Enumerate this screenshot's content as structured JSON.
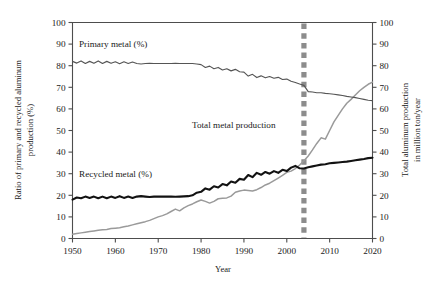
{
  "chart_data": {
    "type": "line",
    "title": "",
    "xlabel": "Year",
    "ylabel": "Ratio of primary and recycled aluminum production (%)",
    "y2label": "Total aluminum production in million ton/year",
    "xlim": [
      1950,
      2020
    ],
    "ylim": [
      0,
      100
    ],
    "y2lim": [
      0,
      100
    ],
    "grid": false,
    "legend_position": "inline-annotations",
    "xticks": [
      1950,
      1960,
      1970,
      1980,
      1990,
      2000,
      2010,
      2020
    ],
    "yticks": [
      0,
      10,
      20,
      30,
      40,
      50,
      60,
      70,
      80,
      90,
      100
    ],
    "y2ticks": [
      0,
      10,
      20,
      30,
      40,
      50,
      60,
      70,
      80,
      90,
      100
    ],
    "annotations": [
      {
        "name": "primary-metal-label",
        "text": "Primary metal (%)",
        "x": 1954,
        "y": 88
      },
      {
        "name": "recycled-metal-label",
        "text": "Recycled metal (%)",
        "x": 1954,
        "y": 27
      },
      {
        "name": "total-metal-label",
        "text": "Total metal production",
        "x": 1987,
        "y": 52
      },
      {
        "name": "marker-year-2004",
        "text": "",
        "x": 2004,
        "y": 0
      }
    ],
    "marker_line": {
      "x": 2004,
      "style": "dashed",
      "color": "#8c8c8c",
      "label": ""
    },
    "x": [
      1950,
      1951,
      1952,
      1953,
      1954,
      1955,
      1956,
      1957,
      1958,
      1959,
      1960,
      1961,
      1962,
      1963,
      1964,
      1965,
      1966,
      1967,
      1968,
      1969,
      1970,
      1971,
      1972,
      1973,
      1974,
      1975,
      1976,
      1977,
      1978,
      1979,
      1980,
      1981,
      1982,
      1983,
      1984,
      1985,
      1986,
      1987,
      1988,
      1989,
      1990,
      1991,
      1992,
      1993,
      1994,
      1995,
      1996,
      1997,
      1998,
      1999,
      2000,
      2001,
      2002,
      2003,
      2004,
      2005,
      2006,
      2007,
      2008,
      2009,
      2010,
      2011,
      2012,
      2013,
      2014,
      2015,
      2016,
      2017,
      2018,
      2019,
      2020
    ],
    "series": [
      {
        "name": "Primary metal (%)",
        "axis": "left",
        "color": "#555555",
        "units": "%",
        "values": [
          82.0,
          81.2,
          82.2,
          81.0,
          82.0,
          81.1,
          82.2,
          81.0,
          82.0,
          81.1,
          81.8,
          80.9,
          81.8,
          81.0,
          81.7,
          81.0,
          80.8,
          81.0,
          81.1,
          81.0,
          81.0,
          81.0,
          81.0,
          81.0,
          81.1,
          81.0,
          81.0,
          81.0,
          81.0,
          80.8,
          80.5,
          79.2,
          79.8,
          78.6,
          79.2,
          78.0,
          78.6,
          77.6,
          78.3,
          77.2,
          77.0,
          75.2,
          76.0,
          74.5,
          75.3,
          74.4,
          75.0,
          74.2,
          74.6,
          73.6,
          73.8,
          72.8,
          72.2,
          71.5,
          70.9,
          68.0,
          67.8,
          67.5,
          67.5,
          67.2,
          67.0,
          66.8,
          66.5,
          66.2,
          65.8,
          65.5,
          65.2,
          64.8,
          64.4,
          64.0,
          63.8
        ]
      },
      {
        "name": "Recycled metal (%)",
        "axis": "left",
        "color": "#121212",
        "units": "%",
        "values": [
          18.0,
          19.0,
          18.6,
          19.4,
          18.8,
          19.4,
          18.6,
          19.4,
          18.6,
          19.4,
          18.8,
          19.6,
          18.8,
          19.4,
          18.8,
          19.4,
          19.6,
          19.4,
          19.2,
          19.4,
          19.4,
          19.4,
          19.4,
          19.4,
          19.3,
          19.4,
          19.5,
          19.6,
          20.0,
          21.2,
          21.6,
          23.2,
          22.6,
          24.2,
          23.6,
          25.2,
          24.6,
          26.4,
          25.8,
          27.6,
          27.2,
          29.4,
          28.4,
          30.4,
          29.5,
          30.8,
          30.0,
          31.2,
          30.4,
          31.8,
          31.2,
          32.8,
          33.6,
          32.5,
          32.4,
          33.0,
          33.4,
          33.8,
          34.2,
          34.4,
          34.8,
          35.0,
          35.2,
          35.4,
          35.6,
          35.9,
          36.2,
          36.5,
          36.8,
          37.2,
          37.4
        ]
      },
      {
        "name": "Total metal production",
        "axis": "right",
        "color": "#9a9a9a",
        "units": "million ton/year",
        "values": [
          2.0,
          2.3,
          2.6,
          2.9,
          3.2,
          3.5,
          3.8,
          4.0,
          4.2,
          4.6,
          4.8,
          5.0,
          5.4,
          5.8,
          6.3,
          6.8,
          7.3,
          7.8,
          8.4,
          9.2,
          10.0,
          10.6,
          11.4,
          12.5,
          13.6,
          12.8,
          14.2,
          15.2,
          16.0,
          17.0,
          17.8,
          17.2,
          16.4,
          17.2,
          18.4,
          18.6,
          18.8,
          19.6,
          21.4,
          22.0,
          22.4,
          22.2,
          22.0,
          22.6,
          23.6,
          24.8,
          25.6,
          26.8,
          28.0,
          29.2,
          30.6,
          31.2,
          32.4,
          34.0,
          36.0,
          38.2,
          41.0,
          44.0,
          46.6,
          46.0,
          50.0,
          54.0,
          57.0,
          60.0,
          62.6,
          64.4,
          66.4,
          68.4,
          70.0,
          71.4,
          72.4
        ]
      }
    ]
  }
}
